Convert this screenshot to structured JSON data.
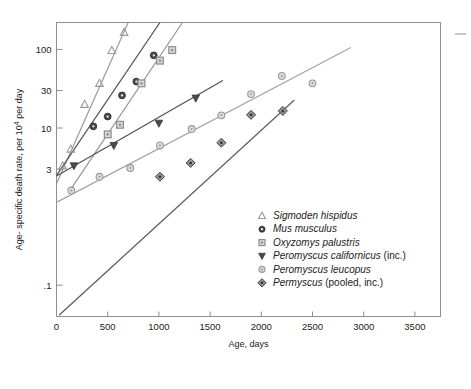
{
  "chart_data": {
    "type": "scatter",
    "title": "",
    "xlabel": "Age, days",
    "ylabel": "Age- specific death rate, per 10⁴ per day",
    "ylabel_parts": {
      "pre": "Age- specific death rate, per 10",
      "sup": "4",
      "post": " per day"
    },
    "xlim": [
      0,
      3750
    ],
    "ylim": [
      0.04,
      220
    ],
    "yscale": "log",
    "xscale": "linear",
    "grid": false,
    "legend_position": "inside-lower-right",
    "xticks": [
      0,
      500,
      1000,
      1500,
      2000,
      2500,
      3000,
      3500
    ],
    "xtick_labels": [
      "0",
      "500",
      "1000",
      "1500",
      "2000",
      "2500",
      "3000",
      "3500"
    ],
    "yticks": [
      0.1,
      3,
      10,
      30,
      100
    ],
    "ytick_labels": [
      ".1",
      "3",
      "10",
      "30",
      "100"
    ],
    "series": [
      {
        "name": "Sigmoden hispidus",
        "marker": "triangle-up",
        "color": "#9a9a9a",
        "line_color": "#a0a0a0",
        "points": [
          {
            "x": 60,
            "y": 3.3
          },
          {
            "x": 140,
            "y": 5.4
          },
          {
            "x": 275,
            "y": 20.0
          },
          {
            "x": 420,
            "y": 37.0
          },
          {
            "x": 540,
            "y": 97.0
          },
          {
            "x": 660,
            "y": 165.0
          }
        ],
        "fit_line": {
          "x0": 0,
          "y0": 1.95,
          "x1": 700,
          "y1": 220
        }
      },
      {
        "name": "Mus musculus",
        "marker": "circle-filled",
        "color": "#4a4a4a",
        "line_color": "#555555",
        "points": [
          {
            "x": 360,
            "y": 10.5
          },
          {
            "x": 500,
            "y": 14.0
          },
          {
            "x": 640,
            "y": 26.0
          },
          {
            "x": 780,
            "y": 39.0
          },
          {
            "x": 950,
            "y": 84.0
          }
        ],
        "fit_line": {
          "x0": 0,
          "y0": 2.5,
          "x1": 1010,
          "y1": 220
        }
      },
      {
        "name": "Oxyzomys palustris",
        "marker": "square",
        "color": "#8c8c8c",
        "line_color": "#9a9a9a",
        "points": [
          {
            "x": 500,
            "y": 8.3
          },
          {
            "x": 620,
            "y": 11.0
          },
          {
            "x": 830,
            "y": 37.0
          },
          {
            "x": 1010,
            "y": 72.0
          },
          {
            "x": 1130,
            "y": 98.0
          }
        ],
        "fit_line": {
          "x0": 130,
          "y0": 1.6,
          "x1": 1230,
          "y1": 220
        }
      },
      {
        "name": "Peromyscus californicus",
        "name_suffix": "(inc.)",
        "marker": "triangle-down",
        "color": "#4a4a4a",
        "line_color": "#555555",
        "points": [
          {
            "x": 170,
            "y": 3.3
          },
          {
            "x": 560,
            "y": 6.0
          },
          {
            "x": 1000,
            "y": 11.5
          },
          {
            "x": 1360,
            "y": 24.0
          }
        ],
        "fit_line": {
          "x0": 0,
          "y0": 2.45,
          "x1": 1620,
          "y1": 40.0
        }
      },
      {
        "name": "Peromyscus leucopus",
        "marker": "circle-open",
        "color": "#9a9a9a",
        "line_color": "#a5a5a5",
        "points": [
          {
            "x": 145,
            "y": 1.6
          },
          {
            "x": 420,
            "y": 2.4
          },
          {
            "x": 720,
            "y": 3.1
          },
          {
            "x": 1010,
            "y": 6.0
          },
          {
            "x": 1320,
            "y": 9.7
          },
          {
            "x": 1610,
            "y": 14.5
          },
          {
            "x": 1900,
            "y": 27.0
          },
          {
            "x": 2200,
            "y": 46.0
          },
          {
            "x": 2500,
            "y": 37.0
          }
        ],
        "fit_line": {
          "x0": 0,
          "y0": 1.13,
          "x1": 2870,
          "y1": 105.0
        }
      },
      {
        "name": "Permyscus",
        "name_suffix": "(pooled, inc.)",
        "marker": "diamond",
        "color": "#5c5c5c",
        "line_color": "#606060",
        "points": [
          {
            "x": 1010,
            "y": 2.4
          },
          {
            "x": 1310,
            "y": 3.6
          },
          {
            "x": 1610,
            "y": 6.5
          },
          {
            "x": 1900,
            "y": 14.7
          },
          {
            "x": 2210,
            "y": 16.5
          }
        ],
        "fit_line": {
          "x0": 30,
          "y0": 0.042,
          "x1": 2320,
          "y1": 22.5
        }
      }
    ]
  },
  "legend": {
    "entries": [
      {
        "label": "Sigmoden hispidus",
        "suffix": "",
        "marker": "triangle-up",
        "color": "#9a9a9a"
      },
      {
        "label": "Mus musculus",
        "suffix": "",
        "marker": "circle-filled",
        "color": "#4a4a4a"
      },
      {
        "label": "Oxyzomys palustris",
        "suffix": "",
        "marker": "square",
        "color": "#8c8c8c"
      },
      {
        "label": "Peromyscus californicus",
        "suffix": " (inc.)",
        "marker": "triangle-down",
        "color": "#4a4a4a"
      },
      {
        "label": "Peromyscus leucopus",
        "suffix": "",
        "marker": "circle-open",
        "color": "#9a9a9a"
      },
      {
        "label": "Permyscus",
        "suffix": " (pooled, inc.)",
        "marker": "diamond",
        "color": "#5c5c5c"
      }
    ]
  },
  "margin_mark": {
    "present": true,
    "kind": "edge-dash"
  }
}
